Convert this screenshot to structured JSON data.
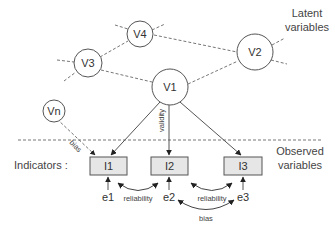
{
  "diagram": {
    "regions": {
      "latent_label_line1": "Latent",
      "latent_label_line2": "variables",
      "observed_label_line1": "Observed",
      "observed_label_line2": "variables",
      "indicators_label": "Indicators :"
    },
    "latent_nodes": [
      {
        "id": "V1",
        "label": "V1"
      },
      {
        "id": "V2",
        "label": "V2"
      },
      {
        "id": "V3",
        "label": "V3"
      },
      {
        "id": "V4",
        "label": "V4"
      },
      {
        "id": "Vn",
        "label": "Vn"
      }
    ],
    "indicators": [
      {
        "id": "I1",
        "label": "I1"
      },
      {
        "id": "I2",
        "label": "I2"
      },
      {
        "id": "I3",
        "label": "I3"
      }
    ],
    "errors": [
      {
        "id": "e1",
        "label": "e1"
      },
      {
        "id": "e2",
        "label": "e2"
      },
      {
        "id": "e3",
        "label": "e3"
      }
    ],
    "edge_labels": {
      "validity": "validity",
      "bias_vn": "bias",
      "reliability_1": "reliability",
      "reliability_2": "reliability",
      "bias_errors": "bias"
    },
    "edges": [
      {
        "from": "V1",
        "to": "I1",
        "type": "solid-arrow"
      },
      {
        "from": "V1",
        "to": "I2",
        "type": "solid-arrow",
        "label": "validity"
      },
      {
        "from": "V1",
        "to": "I3",
        "type": "solid-arrow"
      },
      {
        "from": "Vn",
        "to": "I1",
        "type": "dashed-arrow",
        "label": "bias"
      },
      {
        "from": "e1",
        "to": "I1",
        "type": "solid-arrow"
      },
      {
        "from": "e2",
        "to": "I2",
        "type": "solid-arrow"
      },
      {
        "from": "e3",
        "to": "I3",
        "type": "solid-arrow"
      },
      {
        "from": "I1",
        "to": "I2",
        "type": "curved-double-arrow",
        "label": "reliability"
      },
      {
        "from": "I2",
        "to": "I3",
        "type": "curved-double-arrow",
        "label": "reliability"
      },
      {
        "from": "e2",
        "to": "e3",
        "type": "curved-double-arrow",
        "label": "bias"
      },
      {
        "from": "V3",
        "to": "V4",
        "type": "dashed"
      },
      {
        "from": "V3",
        "to": "V1",
        "type": "dashed"
      },
      {
        "from": "V4",
        "to": "V2",
        "type": "dashed"
      },
      {
        "from": "V1",
        "to": "V2",
        "type": "dashed"
      }
    ],
    "colors": {
      "stroke": "#555555",
      "box_fill": "#e6e6e6",
      "text": "#333333"
    }
  }
}
